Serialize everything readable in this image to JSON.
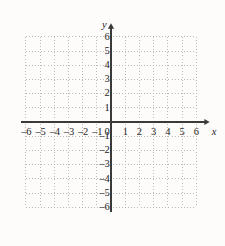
{
  "figure": {
    "kind": "cartesian-coordinate-plane",
    "background_color": "#fdfcfa",
    "axis_color": "#3a3a3a",
    "grid_color": "#b9b9b9",
    "label_color": "#262626"
  },
  "axes": {
    "x_label": "x",
    "y_label": "y",
    "origin_label": "0"
  },
  "chart_data": {
    "type": "scatter",
    "title": "",
    "xlabel": "x",
    "ylabel": "y",
    "xlim": [
      -6,
      6
    ],
    "ylim": [
      -6,
      6
    ],
    "grid": true,
    "grid_style": "dotted",
    "grid_step": 1,
    "legend": null,
    "series": [],
    "x_tick_labels": [
      "–6",
      "–5",
      "–4",
      "–3",
      "–2",
      "–1",
      "0",
      "1",
      "2",
      "3",
      "4",
      "5",
      "6"
    ],
    "x_tick_values": [
      -6,
      -5,
      -4,
      -3,
      -2,
      -1,
      0,
      1,
      2,
      3,
      4,
      5,
      6
    ],
    "y_tick_labels": [
      "6",
      "5",
      "4",
      "3",
      "2",
      "1",
      "–1",
      "–2",
      "–3",
      "–4",
      "–5",
      "–6"
    ],
    "y_tick_values": [
      6,
      5,
      4,
      3,
      2,
      1,
      -1,
      -2,
      -3,
      -4,
      -5,
      -6
    ]
  }
}
